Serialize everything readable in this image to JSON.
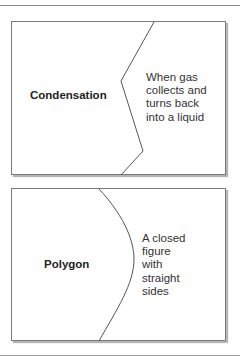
{
  "cards": [
    {
      "term": "Condensation",
      "definition_lines": [
        "When gas",
        "collects and",
        "turns back",
        "into a liquid"
      ],
      "divider_shape": "zigzag"
    },
    {
      "term": "Polygon",
      "definition_lines": [
        "A closed",
        "figure",
        "with",
        "straight",
        "sides"
      ],
      "divider_shape": "curve"
    }
  ],
  "colors": {
    "border": "#7a7a7a",
    "divider": "#555555",
    "text": "#2a2a2a"
  }
}
